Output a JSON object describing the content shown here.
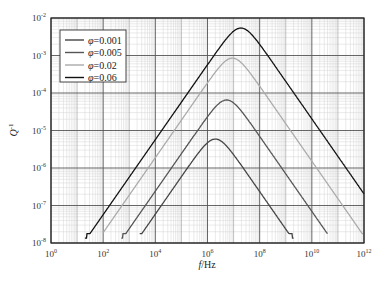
{
  "chart_data": {
    "type": "line",
    "title": "",
    "xlabel": "f/Hz",
    "ylabel": "Q^-1",
    "xscale": "log",
    "yscale": "log",
    "xlim": [
      1,
      1000000000000.0
    ],
    "ylim": [
      1e-08,
      0.01
    ],
    "grid": true,
    "legend_position": "upper left",
    "x_ticks": [
      "10^0",
      "10^2",
      "10^4",
      "10^6",
      "10^8",
      "10^10",
      "10^12"
    ],
    "y_ticks": [
      "10^-8",
      "10^-7",
      "10^-6",
      "10^-5",
      "10^-4",
      "10^-3",
      "10^-2"
    ],
    "series": [
      {
        "name": "φ=0.001",
        "color": "#444444",
        "peak_f": 2000000.0,
        "peak_q": 5.9e-06,
        "log_f_start": 3.4,
        "log_f_end": 9.3
      },
      {
        "name": "φ=0.005",
        "color": "#555555",
        "peak_f": 5400000.0,
        "peak_q": 6.5e-05,
        "log_f_start": 2.7,
        "log_f_end": 10.6
      },
      {
        "name": "φ=0.02",
        "color": "#aaaaaa",
        "peak_f": 9000000.0,
        "peak_q": 0.00085,
        "log_f_start": 2.0,
        "log_f_end": 12.0
      },
      {
        "name": "φ=0.06",
        "color": "#111111",
        "peak_f": 19000000.0,
        "peak_q": 0.0054,
        "log_f_start": 1.3,
        "log_f_end": 12.0
      }
    ]
  },
  "axes": {
    "x_label_main": "f",
    "x_label_unit": "/Hz",
    "y_label_main": "Q",
    "y_label_exp": "-1",
    "x_tick_base": "10",
    "x_tick_exps": [
      "0",
      "2",
      "4",
      "6",
      "8",
      "10",
      "12"
    ],
    "y_tick_base": "10",
    "y_tick_exps": [
      "-2",
      "-3",
      "-4",
      "-5",
      "-6",
      "-7",
      "-8"
    ]
  },
  "legend": {
    "items": [
      {
        "symbol": "φ",
        "label": "=0.001",
        "color": "#444444"
      },
      {
        "symbol": "φ",
        "label": "=0.005",
        "color": "#555555"
      },
      {
        "symbol": "φ",
        "label": "=0.02",
        "color": "#aaaaaa"
      },
      {
        "symbol": "φ",
        "label": "=0.06",
        "color": "#111111"
      }
    ]
  }
}
